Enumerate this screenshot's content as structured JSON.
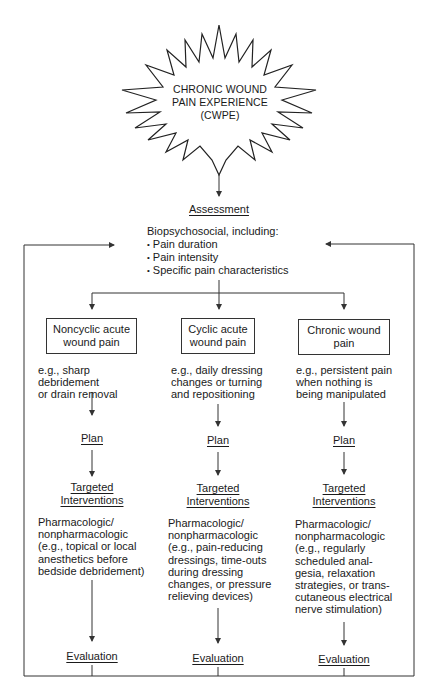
{
  "diagram": {
    "start": {
      "shape": "starburst",
      "lines": [
        "CHRONIC WOUND",
        "PAIN EXPERIENCE",
        "(CWPE)"
      ]
    },
    "assessment": {
      "heading": "Assessment",
      "intro": "Biopsychosocial, including:",
      "bullets": [
        "Pain duration",
        "Pain intensity",
        "Specific pain characteristics"
      ]
    },
    "columns": [
      {
        "type_box": [
          "Noncyclic acute",
          "wound pain"
        ],
        "example": [
          "e.g., sharp debridement",
          "or drain removal"
        ],
        "plan": "Plan",
        "interventions_heading": [
          "Targeted",
          "Interventions"
        ],
        "interventions_body": [
          "Pharmacologic/",
          "nonpharmacologic",
          "(e.g., topical or local",
          "anesthetics before",
          "bedside debridement)"
        ],
        "evaluation": "Evaluation"
      },
      {
        "type_box": [
          "Cyclic acute",
          "wound pain"
        ],
        "example": [
          "e.g., daily dressing",
          "changes or turning",
          "and repositioning"
        ],
        "plan": "Plan",
        "interventions_heading": [
          "Targeted",
          "Interventions"
        ],
        "interventions_body": [
          "Pharmacologic/",
          "nonpharmacologic",
          "(e.g., pain-reducing",
          "dressings, time-outs",
          "during dressing",
          "changes, or pressure",
          "relieving devices)"
        ],
        "evaluation": "Evaluation"
      },
      {
        "type_box": [
          "Chronic wound",
          "pain"
        ],
        "example": [
          "e.g., persistent pain",
          "when nothing is",
          "being manipulated"
        ],
        "plan": "Plan",
        "interventions_heading": [
          "Targeted",
          "Interventions"
        ],
        "interventions_body": [
          "Pharmacologic/",
          "nonpharmacologic",
          "(e.g., regularly",
          "scheduled anal-",
          "gesia, relaxation",
          "strategies, or trans-",
          "cutaneous electrical",
          "nerve stimulation)"
        ],
        "evaluation": "Evaluation"
      }
    ],
    "feedback_loops": [
      "left: Evaluation back to Assessment",
      "right: Evaluation back to Assessment"
    ]
  },
  "colors": {
    "line": "#333333",
    "text": "#1a1a1a",
    "background": "#ffffff"
  }
}
